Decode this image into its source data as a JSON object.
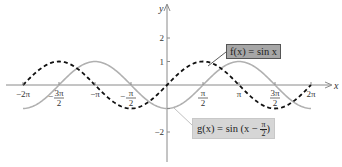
{
  "chart_data": {
    "type": "line",
    "title": "",
    "xlabel": "x",
    "ylabel": "y",
    "xlim": [
      -6.2832,
      6.2832
    ],
    "ylim": [
      -2.6,
      3.4
    ],
    "grid": false,
    "x_ticks": [
      {
        "value": -6.2832,
        "label": "−2π"
      },
      {
        "value": -4.7124,
        "label": "−3π/2"
      },
      {
        "value": -3.1416,
        "label": "−π"
      },
      {
        "value": -1.5708,
        "label": "−π/2"
      },
      {
        "value": 1.5708,
        "label": "π/2"
      },
      {
        "value": 3.1416,
        "label": "π"
      },
      {
        "value": 4.7124,
        "label": "3π/2"
      },
      {
        "value": 6.2832,
        "label": "2π"
      }
    ],
    "y_ticks": [
      {
        "value": 2,
        "label": "2"
      },
      {
        "value": 1,
        "label": "1"
      },
      {
        "value": -1,
        "label": ""
      },
      {
        "value": -2,
        "label": "−2"
      }
    ],
    "series": [
      {
        "name": "f(x) = sin x",
        "function": "sin(x)",
        "style": "dashed",
        "color": "#111111",
        "x": [
          -6.2832,
          -4.7124,
          -3.1416,
          -1.5708,
          0,
          1.5708,
          3.1416,
          4.7124,
          6.2832
        ],
        "values": [
          0,
          1,
          0,
          -1,
          0,
          1,
          0,
          -1,
          0
        ]
      },
      {
        "name": "g(x) = sin (x − π/2)",
        "function": "sin(x - pi/2)",
        "style": "solid",
        "color": "#b0b0b0",
        "x": [
          -6.2832,
          -4.7124,
          -3.1416,
          -1.5708,
          0,
          1.5708,
          3.1416,
          4.7124,
          6.2832
        ],
        "values": [
          -1,
          0,
          1,
          0,
          -1,
          0,
          1,
          0,
          -1
        ]
      }
    ],
    "annotations": [
      {
        "text": "f(x) = sin x",
        "points_to_series": 0
      },
      {
        "text": "g(x) = sin (x − π/2)",
        "points_to_series": 1
      }
    ]
  },
  "labels": {
    "x_axis": "x",
    "y_axis": "y",
    "f_callout_prefix": "f(x) = sin x",
    "g_callout_prefix": "g(x) = sin (x − ",
    "g_callout_num": "π",
    "g_callout_den": "2",
    "g_callout_suffix": ")"
  }
}
